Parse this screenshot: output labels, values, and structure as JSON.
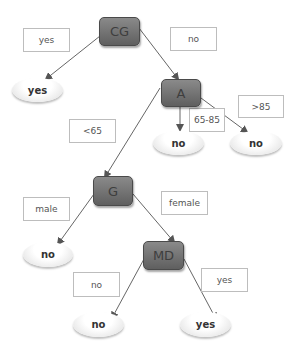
{
  "diagram": {
    "type": "decision-tree",
    "nodes": {
      "cg": "CG",
      "a": "A",
      "g": "G",
      "md": "MD"
    },
    "leaves": {
      "cg_yes": "yes",
      "a_mid_no": "no",
      "a_high_no": "no",
      "g_male_no": "no",
      "md_no": "no",
      "md_yes": "yes"
    },
    "edge_labels": {
      "cg_yes": "yes",
      "cg_no": "no",
      "a_low": "<65",
      "a_mid": "65-85",
      "a_high": ">85",
      "g_male": "male",
      "g_female": "female",
      "md_no": "no",
      "md_yes": "yes"
    }
  }
}
